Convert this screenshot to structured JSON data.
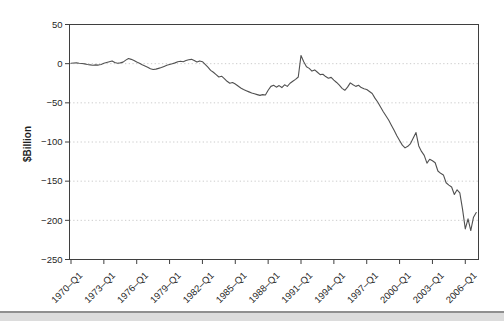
{
  "page": {
    "background": "#ffffff"
  },
  "chart_data": {
    "type": "line",
    "title": "",
    "xlabel": "",
    "ylabel": "$Billion",
    "frequency": "quarterly",
    "x_start": "1970-Q1",
    "x_end": "2007-Q1",
    "ylim": [
      -250,
      50
    ],
    "grid": "dotted-horizontal",
    "legend": "none",
    "x_tick_labels": [
      "1970–Q1",
      "1973–Q1",
      "1976–Q1",
      "1979–Q1",
      "1982–Q1",
      "1985–Q1",
      "1988–Q1",
      "1991–Q1",
      "1994–Q1",
      "1997–Q1",
      "2000–Q1",
      "2003–Q1",
      "2006–Q1"
    ],
    "y_tick_values": [
      50,
      0,
      -50,
      -100,
      -150,
      -200,
      -250
    ],
    "y_tick_labels": [
      "50",
      "0",
      "−50",
      "−100",
      "−150",
      "−200",
      "−250"
    ],
    "series": [
      {
        "name": "balance",
        "values": [
          0.5,
          0.8,
          1.0,
          0.6,
          0.3,
          -0.3,
          -1.0,
          -1.5,
          -2.0,
          -1.5,
          -1.8,
          -1.0,
          0.5,
          1.5,
          2.5,
          3.5,
          1.5,
          0.5,
          1.0,
          2.0,
          4.5,
          6.5,
          5.5,
          4.0,
          2.0,
          0.5,
          -1.5,
          -3.0,
          -4.5,
          -6.5,
          -7.5,
          -7.0,
          -6.0,
          -5.0,
          -3.5,
          -2.0,
          -1.0,
          0.0,
          1.0,
          2.5,
          3.0,
          2.5,
          4.0,
          5.0,
          5.5,
          4.0,
          2.0,
          3.5,
          2.5,
          -1.0,
          -4.5,
          -8.5,
          -11.0,
          -14.0,
          -17.0,
          -16.0,
          -19.0,
          -22.5,
          -25.0,
          -24.0,
          -26.0,
          -28.5,
          -31.0,
          -33.0,
          -34.5,
          -36.0,
          -37.5,
          -38.5,
          -39.5,
          -40.5,
          -39.5,
          -40.0,
          -34.0,
          -29.0,
          -27.5,
          -30.0,
          -28.0,
          -30.5,
          -27.0,
          -29.0,
          -25.0,
          -22.5,
          -20.0,
          -17.0,
          10.5,
          2.5,
          -4.0,
          -6.0,
          -9.5,
          -8.0,
          -11.0,
          -14.0,
          -13.5,
          -16.5,
          -18.5,
          -17.5,
          -21.0,
          -24.0,
          -27.5,
          -31.5,
          -34.0,
          -30.0,
          -24.5,
          -27.0,
          -29.0,
          -27.5,
          -30.5,
          -32.0,
          -33.0,
          -35.5,
          -38.0,
          -44.0,
          -49.0,
          -55.0,
          -61.0,
          -66.5,
          -72.0,
          -78.5,
          -85.0,
          -92.0,
          -98.0,
          -104.0,
          -107.5,
          -105.5,
          -102.0,
          -95.0,
          -88.0,
          -105.0,
          -112.0,
          -117.0,
          -127.0,
          -122.0,
          -124.0,
          -126.5,
          -137.0,
          -140.0,
          -142.0,
          -152.0,
          -155.0,
          -157.5,
          -167.0,
          -161.0,
          -165.0,
          -186.0,
          -211.0,
          -198.0,
          -213.0,
          -196.0,
          -190.0
        ]
      }
    ]
  },
  "colors": {
    "line": "#515151",
    "axis": "#3f3f3f",
    "grid": "#cccccc",
    "text": "#1f1f1f",
    "divider_fill": "#dcdcdc",
    "divider_edge": "#8f8f8f"
  }
}
